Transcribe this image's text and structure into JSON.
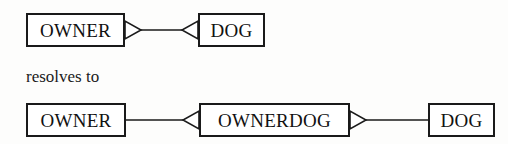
{
  "figure": {
    "caption": "resolves to",
    "background_color": "#fdfdfc",
    "line_color": "#1a1a1a"
  },
  "top_row": {
    "entities": [
      {
        "label": "OWNER",
        "x": 26,
        "y": 13,
        "w": 99,
        "h": 34
      },
      {
        "label": "DOG",
        "x": 198,
        "y": 13,
        "w": 67,
        "h": 34
      }
    ],
    "relationship": {
      "left_cardinality": "many",
      "right_cardinality": "many",
      "left_marker": "crowfoot-right",
      "right_marker": "crowfoot-left"
    }
  },
  "bottom_row": {
    "entities": [
      {
        "label": "OWNER",
        "x": 26,
        "y": 103,
        "w": 100,
        "h": 34
      },
      {
        "label": "OWNERDOG",
        "x": 199,
        "y": 103,
        "w": 151,
        "h": 34
      },
      {
        "label": "DOG",
        "x": 428,
        "y": 103,
        "w": 67,
        "h": 34
      }
    ],
    "relationships": [
      {
        "from": "OWNER",
        "to": "OWNERDOG",
        "left_marker": "none",
        "right_marker": "crowfoot-left"
      },
      {
        "from": "OWNERDOG",
        "to": "DOG",
        "left_marker": "crowfoot-right",
        "right_marker": "none"
      }
    ]
  }
}
